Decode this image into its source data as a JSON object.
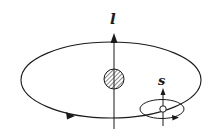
{
  "diagram": {
    "type": "spin-orbit coupling illustration",
    "labels": {
      "orbital_angular_momentum": "l",
      "spin_angular_momentum": "s"
    },
    "elements": [
      "orbit-ellipse",
      "orbital-axis-arrow",
      "nucleus (hatched circle)",
      "electron (open circle)",
      "spin-ellipse",
      "spin-axis-arrow"
    ],
    "colors": {
      "stroke": "#1a1a1a",
      "background": "#ffffff"
    }
  }
}
